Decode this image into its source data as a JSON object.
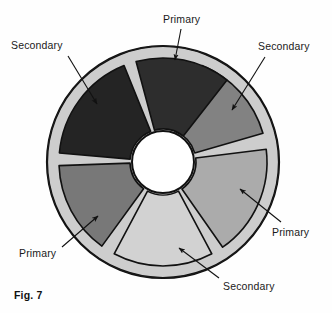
{
  "figure": {
    "caption": "Fig. 7",
    "background_color": "#fefefe"
  },
  "disc": {
    "center_x": 163,
    "center_y": 162,
    "outer_radius": 116,
    "segment_outer_radius": 104,
    "hub_radius": 31,
    "hub_color": "#ffffff",
    "rim_color": "#cfcfcf",
    "outline_color": "#111111",
    "segment_count": 6,
    "segments": [
      {
        "id": "segment-primary-top",
        "label": "Primary",
        "role": "primary",
        "fill": "#828282",
        "start_angle": -68,
        "end_angle": -16,
        "position": "top"
      },
      {
        "id": "segment-secondary-upper-right",
        "label": "Secondary",
        "role": "secondary",
        "fill": "#ababab",
        "start_angle": -7,
        "end_angle": 55,
        "position": "upper-right"
      },
      {
        "id": "segment-primary-lower-right",
        "label": "Primary",
        "role": "primary",
        "fill": "#d2d2d2",
        "start_angle": 62,
        "end_angle": 118,
        "position": "lower-right"
      },
      {
        "id": "segment-secondary-bottom",
        "label": "Secondary",
        "role": "secondary",
        "fill": "#787878",
        "start_angle": 126,
        "end_angle": 178,
        "position": "bottom"
      },
      {
        "id": "segment-primary-lower-left",
        "label": "Primary",
        "role": "primary",
        "fill": "#242424",
        "start_angle": 185,
        "end_angle": 248,
        "position": "lower-left"
      },
      {
        "id": "segment-secondary-upper-left",
        "label": "Secondary",
        "role": "secondary",
        "fill": "#2d2d2d",
        "start_angle": 255,
        "end_angle": 308,
        "position": "upper-left"
      }
    ]
  },
  "callouts": [
    {
      "id": "callout-primary-top",
      "label": "Primary",
      "text_x": 163,
      "text_y": 14,
      "leader_from_x": 181,
      "leader_from_y": 29,
      "leader_to_x": 175,
      "leader_to_y": 60,
      "target_segment": "segment-primary-top"
    },
    {
      "id": "callout-secondary-left",
      "label": "Secondary",
      "text_x": 11,
      "text_y": 40,
      "leader_from_x": 68,
      "leader_from_y": 56,
      "leader_to_x": 97,
      "leader_to_y": 104,
      "target_segment": "segment-secondary-upper-left"
    },
    {
      "id": "callout-secondary-right",
      "label": "Secondary",
      "text_x": 258,
      "text_y": 41,
      "leader_from_x": 265,
      "leader_from_y": 57,
      "leader_to_x": 232,
      "leader_to_y": 110,
      "target_segment": "segment-secondary-upper-right"
    },
    {
      "id": "callout-primary-right",
      "label": "Primary",
      "text_x": 272,
      "text_y": 227,
      "leader_from_x": 281,
      "leader_from_y": 222,
      "leader_to_x": 240,
      "leader_to_y": 189,
      "target_segment": "segment-primary-lower-right"
    },
    {
      "id": "callout-primary-left",
      "label": "Primary",
      "text_x": 19,
      "text_y": 248,
      "leader_from_x": 62,
      "leader_from_y": 247,
      "leader_to_x": 98,
      "leader_to_y": 216,
      "target_segment": "segment-primary-lower-left"
    },
    {
      "id": "callout-secondary-bottom",
      "label": "Secondary",
      "text_x": 223,
      "text_y": 281,
      "leader_from_x": 219,
      "leader_from_y": 278,
      "leader_to_x": 179,
      "leader_to_y": 248,
      "target_segment": "segment-secondary-bottom"
    }
  ]
}
